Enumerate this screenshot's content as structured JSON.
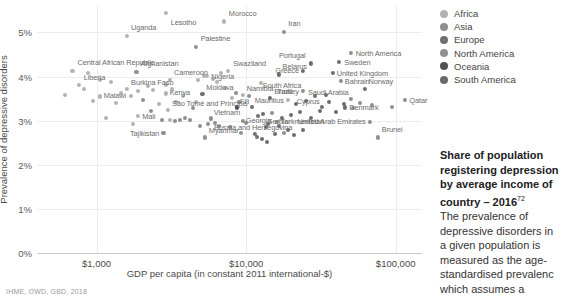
{
  "chart_data": {
    "type": "scatter",
    "title": "",
    "xlabel": "GDP per capita (in constant 2011 international-$)",
    "ylabel": "Prevalence of depressive disorders",
    "x_scale": "log",
    "xlim": [
      400,
      150000
    ],
    "ylim": [
      0,
      5.6
    ],
    "x_ticks": [
      {
        "value": 1000,
        "label": "$1,000"
      },
      {
        "value": 10000,
        "label": "$10,000"
      },
      {
        "value": 100000,
        "label": "$100,000"
      }
    ],
    "y_ticks": [
      {
        "value": 0,
        "label": "0%"
      },
      {
        "value": 1,
        "label": "1%"
      },
      {
        "value": 2,
        "label": "2%"
      },
      {
        "value": 3,
        "label": "3%"
      },
      {
        "value": 4,
        "label": "4%"
      },
      {
        "value": 5,
        "label": "5%"
      }
    ],
    "grid": true,
    "legend_position": "top-right",
    "legend": [
      {
        "name": "Africa",
        "color": "#b3b3b3"
      },
      {
        "name": "Asia",
        "color": "#8f8f8f"
      },
      {
        "name": "Europe",
        "color": "#6e6e6e"
      },
      {
        "name": "North America",
        "color": "#909090"
      },
      {
        "name": "Oceania",
        "color": "#525252"
      },
      {
        "name": "South America",
        "color": "#6a6a6a"
      }
    ],
    "points": [
      {
        "label": "Lesotho",
        "x": 2900,
        "y": 5.45,
        "group": "Africa",
        "lx": 5,
        "ly": 9
      },
      {
        "label": "Morocco",
        "x": 7100,
        "y": 5.25,
        "group": "Africa",
        "lx": 5,
        "ly": -8
      },
      {
        "label": "Uganda",
        "x": 1600,
        "y": 4.92,
        "group": "Africa",
        "lx": 4,
        "ly": -9
      },
      {
        "label": "Iran",
        "x": 18000,
        "y": 5.02,
        "group": "Asia",
        "lx": 4,
        "ly": -9
      },
      {
        "label": "Palestine",
        "x": 4600,
        "y": 4.68,
        "group": "Asia",
        "lx": 5,
        "ly": -9
      },
      {
        "label": "Central African Republic",
        "x": 690,
        "y": 4.12,
        "group": "Africa",
        "lx": 5,
        "ly": -9
      },
      {
        "label": "Afghanistan",
        "x": 1850,
        "y": 4.1,
        "group": "Asia",
        "lx": 4,
        "ly": -9
      },
      {
        "label": "North America",
        "x": 50000,
        "y": 4.53,
        "group": "North America",
        "lx": 5,
        "ly": 0
      },
      {
        "label": "Swaziland",
        "x": 7600,
        "y": 4.13,
        "group": "Africa",
        "lx": 5,
        "ly": -8
      },
      {
        "label": "Nigeria",
        "x": 5500,
        "y": 4.02,
        "group": "Africa",
        "lx": 4,
        "ly": 0
      },
      {
        "label": "Sweden",
        "x": 42000,
        "y": 4.33,
        "group": "Europe",
        "lx": 5,
        "ly": 0
      },
      {
        "label": "Portugal",
        "x": 27000,
        "y": 4.3,
        "group": "Europe",
        "lx": -5,
        "ly": -8,
        "anchor": "end"
      },
      {
        "label": "Belarus",
        "x": 16500,
        "y": 4.05,
        "group": "Europe",
        "lx": 4,
        "ly": -8
      },
      {
        "label": "Greece",
        "x": 24000,
        "y": 4.12,
        "group": "Europe",
        "lx": -4,
        "ly": -1,
        "anchor": "end"
      },
      {
        "label": "United Kingdom",
        "x": 38000,
        "y": 4.08,
        "group": "Europe",
        "lx": 4,
        "ly": 0
      },
      {
        "label": "Liberia",
        "x": 760,
        "y": 3.82,
        "group": "Africa",
        "lx": 5,
        "ly": -8
      },
      {
        "label": "Cameroon",
        "x": 3100,
        "y": 3.92,
        "group": "Africa",
        "lx": 4,
        "ly": -8
      },
      {
        "label": "Burkina Faso",
        "x": 1600,
        "y": 3.72,
        "group": "Africa",
        "lx": 4,
        "ly": -7
      },
      {
        "label": "South Africa",
        "x": 12500,
        "y": 3.85,
        "group": "Africa",
        "lx": 2,
        "ly": 2
      },
      {
        "label": "Bahrain",
        "x": 43000,
        "y": 3.9,
        "group": "Asia",
        "lx": 4,
        "ly": 0
      },
      {
        "label": "Malawi",
        "x": 1050,
        "y": 3.55,
        "group": "Africa",
        "lx": 4,
        "ly": -1
      },
      {
        "label": "Kenya",
        "x": 2900,
        "y": 3.62,
        "group": "Africa",
        "lx": 4,
        "ly": -1
      },
      {
        "label": "Moldova",
        "x": 5100,
        "y": 3.6,
        "group": "Europe",
        "lx": 4,
        "ly": -7
      },
      {
        "label": "Namibia",
        "x": 9500,
        "y": 3.58,
        "group": "Africa",
        "lx": 4,
        "ly": -7
      },
      {
        "label": "Turkey",
        "x": 24000,
        "y": 3.67,
        "group": "Asia",
        "lx": -4,
        "ly": 0,
        "anchor": "end"
      },
      {
        "label": "Norway",
        "x": 62000,
        "y": 3.72,
        "group": "Europe",
        "lx": 4,
        "ly": -8
      },
      {
        "label": "Brazil",
        "x": 14500,
        "y": 3.52,
        "group": "South America",
        "lx": 4,
        "ly": -7
      },
      {
        "label": "Mauritius",
        "x": 19000,
        "y": 3.48,
        "group": "Africa",
        "lx": -4,
        "ly": 0,
        "anchor": "end"
      },
      {
        "label": "Saudi Arabia",
        "x": 50000,
        "y": 3.5,
        "group": "Asia",
        "lx": -2,
        "ly": -7,
        "anchor": "end"
      },
      {
        "label": "Qatar",
        "x": 116000,
        "y": 3.48,
        "group": "Asia",
        "lx": 4,
        "ly": 0
      },
      {
        "label": "Mali",
        "x": 1900,
        "y": 3.1,
        "group": "Africa",
        "lx": 4,
        "ly": 0
      },
      {
        "label": "São Tomé and Príncipe",
        "x": 3000,
        "y": 3.25,
        "group": "Africa",
        "lx": 4,
        "ly": -7
      },
      {
        "label": "Fiji",
        "x": 8700,
        "y": 3.3,
        "group": "Oceania",
        "lx": 3,
        "ly": -6
      },
      {
        "label": "Cyprus",
        "x": 32000,
        "y": 3.32,
        "group": "Europe",
        "lx": -2,
        "ly": -6,
        "anchor": "end"
      },
      {
        "label": "Denmark",
        "x": 46000,
        "y": 3.3,
        "group": "Europe",
        "lx": 4,
        "ly": 0
      },
      {
        "label": "Vietnam",
        "x": 5800,
        "y": 3.05,
        "group": "Asia",
        "lx": 3,
        "ly": -6
      },
      {
        "label": "Georgia",
        "x": 9500,
        "y": 3.0,
        "group": "Asia",
        "lx": 3,
        "ly": -1
      },
      {
        "label": "Turkmenistan",
        "x": 16000,
        "y": 2.98,
        "group": "Asia",
        "lx": 4,
        "ly": -1
      },
      {
        "label": "United Arab Emirates",
        "x": 67000,
        "y": 2.98,
        "group": "Asia",
        "lx": -4,
        "ly": -1,
        "anchor": "end"
      },
      {
        "label": "Tajikistan",
        "x": 2800,
        "y": 2.72,
        "group": "Asia",
        "lx": -4,
        "ly": 0,
        "anchor": "end"
      },
      {
        "label": "Serbia",
        "x": 13500,
        "y": 2.85,
        "group": "Europe",
        "lx": 2,
        "ly": -6
      },
      {
        "label": "Myanmar",
        "x": 5300,
        "y": 2.62,
        "group": "Asia",
        "lx": 4,
        "ly": -7
      },
      {
        "label": "Bosnia and Herzegovina",
        "x": 11500,
        "y": 2.7,
        "group": "Europe",
        "lx": -2,
        "ly": -7,
        "anchor": "middle"
      },
      {
        "label": "Brunei",
        "x": 76000,
        "y": 2.62,
        "group": "Asia",
        "lx": 4,
        "ly": -8
      }
    ],
    "unlabeled_points": [
      {
        "x": 620,
        "y": 3.58,
        "group": "Africa"
      },
      {
        "x": 830,
        "y": 3.72,
        "group": "Africa"
      },
      {
        "x": 950,
        "y": 3.45,
        "group": "Africa"
      },
      {
        "x": 1250,
        "y": 3.88,
        "group": "Africa"
      },
      {
        "x": 1350,
        "y": 3.4,
        "group": "Africa"
      },
      {
        "x": 1150,
        "y": 3.05,
        "group": "Africa"
      },
      {
        "x": 1450,
        "y": 3.62,
        "group": "Africa"
      },
      {
        "x": 1700,
        "y": 3.55,
        "group": "Africa"
      },
      {
        "x": 1900,
        "y": 3.68,
        "group": "Africa"
      },
      {
        "x": 2050,
        "y": 3.48,
        "group": "Asia"
      },
      {
        "x": 2200,
        "y": 3.78,
        "group": "Africa"
      },
      {
        "x": 2400,
        "y": 3.7,
        "group": "Africa"
      },
      {
        "x": 2600,
        "y": 3.38,
        "group": "Africa"
      },
      {
        "x": 2300,
        "y": 3.22,
        "group": "Asia"
      },
      {
        "x": 2750,
        "y": 3.02,
        "group": "Asia"
      },
      {
        "x": 3100,
        "y": 3.02,
        "group": "Africa"
      },
      {
        "x": 3350,
        "y": 3.0,
        "group": "Asia"
      },
      {
        "x": 3600,
        "y": 3.02,
        "group": "Asia"
      },
      {
        "x": 3900,
        "y": 3.05,
        "group": "Asia"
      },
      {
        "x": 4200,
        "y": 3.02,
        "group": "Asia"
      },
      {
        "x": 3400,
        "y": 3.42,
        "group": "Africa"
      },
      {
        "x": 3800,
        "y": 3.55,
        "group": "Africa"
      },
      {
        "x": 4400,
        "y": 3.28,
        "group": "Asia"
      },
      {
        "x": 4800,
        "y": 3.92,
        "group": "Africa"
      },
      {
        "x": 5200,
        "y": 4.02,
        "group": "Africa"
      },
      {
        "x": 6000,
        "y": 3.95,
        "group": "Africa"
      },
      {
        "x": 6400,
        "y": 3.88,
        "group": "Africa"
      },
      {
        "x": 6800,
        "y": 4.08,
        "group": "Africa"
      },
      {
        "x": 7200,
        "y": 3.75,
        "group": "Africa"
      },
      {
        "x": 8000,
        "y": 3.52,
        "group": "Africa"
      },
      {
        "x": 8600,
        "y": 3.62,
        "group": "Asia"
      },
      {
        "x": 9000,
        "y": 3.42,
        "group": "Asia"
      },
      {
        "x": 10500,
        "y": 3.55,
        "group": "Asia"
      },
      {
        "x": 11000,
        "y": 3.32,
        "group": "Europe"
      },
      {
        "x": 12000,
        "y": 3.1,
        "group": "Europe"
      },
      {
        "x": 13000,
        "y": 3.15,
        "group": "Europe"
      },
      {
        "x": 14000,
        "y": 2.92,
        "group": "Europe"
      },
      {
        "x": 15000,
        "y": 3.18,
        "group": "Asia"
      },
      {
        "x": 16500,
        "y": 2.88,
        "group": "Europe"
      },
      {
        "x": 17500,
        "y": 3.05,
        "group": "Europe"
      },
      {
        "x": 19000,
        "y": 2.8,
        "group": "Europe"
      },
      {
        "x": 20000,
        "y": 3.12,
        "group": "Europe"
      },
      {
        "x": 21500,
        "y": 3.38,
        "group": "Europe"
      },
      {
        "x": 23000,
        "y": 3.2,
        "group": "Europe"
      },
      {
        "x": 25000,
        "y": 3.45,
        "group": "Europe"
      },
      {
        "x": 27000,
        "y": 3.05,
        "group": "Europe"
      },
      {
        "x": 29000,
        "y": 3.55,
        "group": "Europe"
      },
      {
        "x": 31000,
        "y": 3.22,
        "group": "Europe"
      },
      {
        "x": 34000,
        "y": 3.58,
        "group": "Europe"
      },
      {
        "x": 36000,
        "y": 3.42,
        "group": "Europe"
      },
      {
        "x": 40000,
        "y": 3.2,
        "group": "Europe"
      },
      {
        "x": 45000,
        "y": 3.38,
        "group": "Europe"
      },
      {
        "x": 52000,
        "y": 3.28,
        "group": "North America"
      },
      {
        "x": 58000,
        "y": 3.4,
        "group": "Asia"
      },
      {
        "x": 70000,
        "y": 3.35,
        "group": "Asia"
      },
      {
        "x": 95000,
        "y": 3.3,
        "group": "Asia"
      },
      {
        "x": 10000,
        "y": 2.95,
        "group": "Asia"
      },
      {
        "x": 11800,
        "y": 2.62,
        "group": "Europe"
      },
      {
        "x": 12800,
        "y": 2.58,
        "group": "Europe"
      },
      {
        "x": 13800,
        "y": 2.52,
        "group": "Europe"
      },
      {
        "x": 9200,
        "y": 2.72,
        "group": "Asia"
      },
      {
        "x": 7800,
        "y": 2.85,
        "group": "Asia"
      },
      {
        "x": 6600,
        "y": 2.88,
        "group": "Asia"
      },
      {
        "x": 6200,
        "y": 2.95,
        "group": "Asia"
      },
      {
        "x": 5600,
        "y": 2.92,
        "group": "Asia"
      },
      {
        "x": 4900,
        "y": 2.88,
        "group": "Asia"
      },
      {
        "x": 15500,
        "y": 2.7,
        "group": "Europe"
      },
      {
        "x": 18000,
        "y": 2.72,
        "group": "Asia"
      },
      {
        "x": 21000,
        "y": 2.68,
        "group": "Europe"
      },
      {
        "x": 24000,
        "y": 2.78,
        "group": "Europe"
      },
      {
        "x": 1750,
        "y": 2.92,
        "group": "Africa"
      },
      {
        "x": 2900,
        "y": 3.82,
        "group": "Africa"
      },
      {
        "x": 3200,
        "y": 3.72,
        "group": "Africa"
      },
      {
        "x": 4600,
        "y": 3.42,
        "group": "Africa"
      },
      {
        "x": 880,
        "y": 4.08,
        "group": "Africa"
      },
      {
        "x": 1050,
        "y": 3.92,
        "group": "Africa"
      }
    ]
  },
  "side_panel": {
    "heading_line1": "Share of population",
    "heading_line2": "registering depression",
    "heading_line3": "by average income of",
    "heading_line4": "country – 2016",
    "heading_sup": "72",
    "body_line1": "The prevalence of",
    "body_line2": "depressive disorders in",
    "body_line3": "a given population is",
    "body_line4": "measured as the age-",
    "body_line5": "standardised prevalenc",
    "body_line6": "which assumes a"
  },
  "source": "IHME, OWD, GBD, 2018"
}
